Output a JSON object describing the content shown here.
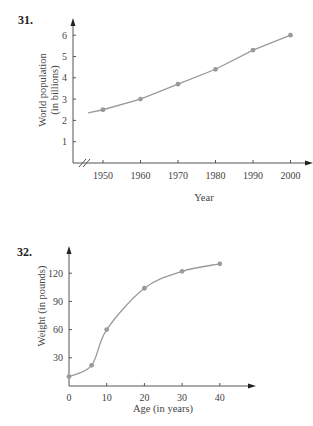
{
  "problems": [
    {
      "number": "31."
    },
    {
      "number": "32."
    }
  ],
  "chart_data": [
    {
      "type": "line",
      "title": "",
      "xlabel": "Year",
      "ylabel": [
        "World population",
        "(in billions)"
      ],
      "x": [
        1950,
        1960,
        1970,
        1980,
        1990,
        2000
      ],
      "values": [
        2.5,
        3.0,
        3.7,
        4.4,
        5.3,
        6.0
      ],
      "x_ticks": [
        "1950",
        "1960",
        "1970",
        "1980",
        "1990",
        "2000"
      ],
      "y_ticks": [
        "1",
        "2",
        "3",
        "4",
        "5",
        "6"
      ],
      "ylim": [
        0,
        6.7
      ],
      "xlim": [
        1940,
        2010
      ],
      "x_axis_break": true,
      "grid": false,
      "line_color": "#9a9a9a",
      "marker_color": "#9a9a9a"
    },
    {
      "type": "line",
      "title": "",
      "xlabel": "Age (in years)",
      "ylabel": "Weight (in pounds)",
      "x": [
        0,
        6,
        10,
        20,
        30,
        40
      ],
      "values": [
        10,
        22,
        60,
        104,
        122,
        130
      ],
      "x_ticks": [
        "0",
        "10",
        "20",
        "30",
        "40"
      ],
      "y_ticks": [
        "30",
        "60",
        "90",
        "120"
      ],
      "ylim": [
        0,
        145
      ],
      "xlim": [
        0,
        49
      ],
      "smooth": true,
      "grid": false,
      "line_color": "#9a9a9a",
      "marker_color": "#9a9a9a"
    }
  ]
}
